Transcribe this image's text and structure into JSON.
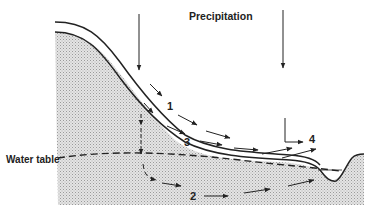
{
  "diagram": {
    "type": "hydrologic-flow-paths",
    "labels": {
      "precipitation": "Precipitation",
      "water_table": "Water table",
      "path1": "1",
      "path2": "2",
      "path3": "3",
      "path4": "4"
    },
    "colors": {
      "line": "#222222",
      "ground_fill": "#d9d9d9",
      "background": "#ffffff"
    }
  }
}
